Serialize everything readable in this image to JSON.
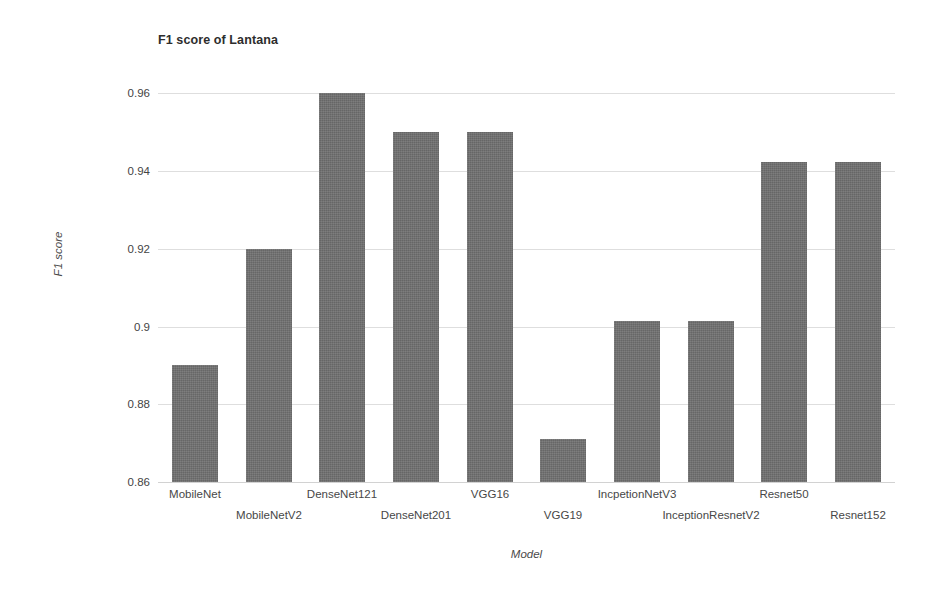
{
  "chart_data": {
    "type": "bar",
    "title": "F1 score of Lantana",
    "xlabel": "Model",
    "ylabel": "F1 score",
    "categories": [
      "MobileNet",
      "MobileNetV2",
      "DenseNet121",
      "DenseNet201",
      "VGG16",
      "VGG19",
      "IncpetionNetV3",
      "InceptionResnetV2",
      "Resnet50",
      "Resnet152"
    ],
    "values": [
      0.89,
      0.92,
      0.96,
      0.95,
      0.95,
      0.871,
      0.9015,
      0.9015,
      0.9423,
      0.9423
    ],
    "ylim": [
      0.86,
      0.965
    ],
    "yticks": [
      0.86,
      0.88,
      0.9,
      0.92,
      0.94,
      0.96
    ],
    "ytick_labels": [
      "0.86",
      "0.88",
      "0.9",
      "0.92",
      "0.94",
      "0.96"
    ],
    "grid": true,
    "legend": false,
    "bar_color": "#6f6f6f",
    "grid_color": "#dedede",
    "background_color": "#ffffff"
  }
}
